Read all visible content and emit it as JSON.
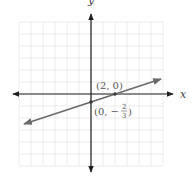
{
  "chart_data": {
    "type": "line",
    "title": "",
    "xlabel": "x",
    "ylabel": "y",
    "xlim": [
      -6,
      6
    ],
    "ylim": [
      -6,
      6
    ],
    "grid": true,
    "series": [
      {
        "name": "line",
        "equation": "y = (1/3)x - 2/3",
        "slope": 0.3333,
        "intercept": -0.6667,
        "x": [
          -6,
          6
        ],
        "y": [
          -2.667,
          1.333
        ]
      }
    ],
    "points": [
      {
        "x": 2,
        "y": 0,
        "label": "(2, 0)"
      },
      {
        "x": 0,
        "y": -0.6667,
        "label": "(0, −2/3)"
      }
    ],
    "annotations": [
      "(2, 0)",
      "(0, −2/3)"
    ]
  },
  "labels": {
    "x_axis": "x",
    "y_axis": "y",
    "point1": "(2, 0)",
    "point2_prefix": "(0, −",
    "point2_num": "2",
    "point2_den": "3",
    "point2_suffix": ")"
  },
  "colors": {
    "axis": "#1e1e1e",
    "line": "#6a6a6a",
    "grid": "#ececec"
  }
}
